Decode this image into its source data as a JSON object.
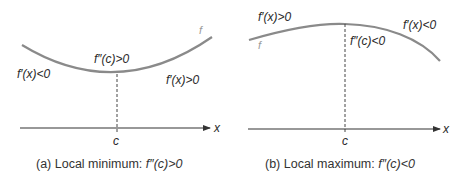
{
  "colors": {
    "curve": "#8a8a8a",
    "axis": "#333333",
    "text": "#2a2a2a",
    "function_label": "#9a9a9a"
  },
  "panels": [
    {
      "id": "a",
      "function_label": "f",
      "center_label": "f″(c)>0",
      "left_label": "f′(x)<0",
      "right_label": "f′(x)>0",
      "axis_label": "x",
      "point_label": "c",
      "caption_prefix": "(a) Local minimum: ",
      "caption_math": "f″(c)>0"
    },
    {
      "id": "b",
      "function_label": "f",
      "center_label": "f″(c)<0",
      "left_label": "f′(x)>0",
      "right_label": "f′(x)<0",
      "axis_label": "x",
      "point_label": "c",
      "caption_prefix": "(b) Local maximum: ",
      "caption_math": "f″(c)<0"
    }
  ]
}
